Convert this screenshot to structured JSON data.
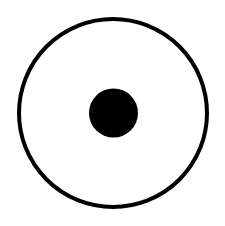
{
  "figure": {
    "symbol_name": "circled-dot",
    "colors": {
      "background": "#ffffff",
      "stroke": "#000000",
      "fill": "#000000"
    }
  }
}
